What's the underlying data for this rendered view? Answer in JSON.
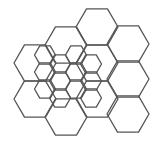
{
  "diagram": {
    "title": "",
    "background": "#ffffff",
    "stroke_color": "#555555",
    "stroke_width": 1.3,
    "orientation": "flat-top",
    "large_hexes": {
      "side": 21,
      "centers": [
        [
          35,
          63
        ],
        [
          35,
          99
        ],
        [
          66,
          45
        ],
        [
          66,
          117
        ],
        [
          97,
          27
        ],
        [
          97,
          63
        ],
        [
          97,
          99
        ],
        [
          128,
          44
        ],
        [
          128,
          79
        ],
        [
          128,
          114
        ]
      ]
    },
    "small_hexes": {
      "side": 10.5,
      "centers": [
        [
          45,
          55
        ],
        [
          45,
          72
        ],
        [
          45,
          89
        ],
        [
          60,
          64
        ],
        [
          60,
          81
        ],
        [
          60,
          98
        ],
        [
          76,
          55
        ],
        [
          76,
          72
        ],
        [
          76,
          89
        ],
        [
          91,
          64
        ],
        [
          91,
          81
        ],
        [
          91,
          98
        ]
      ]
    }
  }
}
